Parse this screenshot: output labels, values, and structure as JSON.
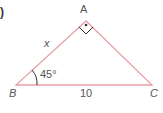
{
  "problem_marker": ")",
  "vertices": {
    "A": "A",
    "B": "B",
    "C": "C"
  },
  "sides": {
    "AB": "x",
    "BC": "10"
  },
  "angle_B": "45°",
  "right_angle_at": "A",
  "colors": {
    "line": "#e8a0a8",
    "text": "#555555"
  }
}
